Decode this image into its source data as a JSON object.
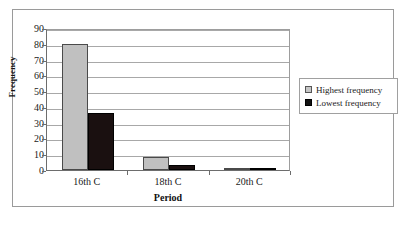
{
  "chart_data": {
    "type": "bar",
    "title": "",
    "categories": [
      "16th C",
      "18th C",
      "20th C"
    ],
    "series": [
      {
        "name": "Highest frequency",
        "values": [
          80,
          8,
          1
        ],
        "color": "#C0C0C0"
      },
      {
        "name": "Lowest frequency",
        "values": [
          36,
          3,
          1
        ],
        "color": "#1A1010"
      }
    ],
    "xlabel": "Period",
    "ylabel": "Frequency",
    "ylim": [
      0,
      90
    ],
    "ytick_step": 10,
    "yticks": [
      0,
      10,
      20,
      30,
      40,
      50,
      60,
      70,
      80,
      90
    ],
    "grid": "horizontal",
    "legend_position": "right"
  },
  "axes": {
    "y_title": "Frequency",
    "x_title": "Period",
    "y_tick_labels": [
      "0",
      "10",
      "20",
      "30",
      "40",
      "50",
      "60",
      "70",
      "80",
      "90"
    ],
    "x_tick_labels": [
      "16th C",
      "18th C",
      "20th C"
    ]
  },
  "legend": {
    "items": [
      {
        "label": "Highest frequency",
        "swatch": "highest-frequency-swatch"
      },
      {
        "label": "Lowest frequency",
        "swatch": "lowest-frequency-swatch"
      }
    ]
  }
}
